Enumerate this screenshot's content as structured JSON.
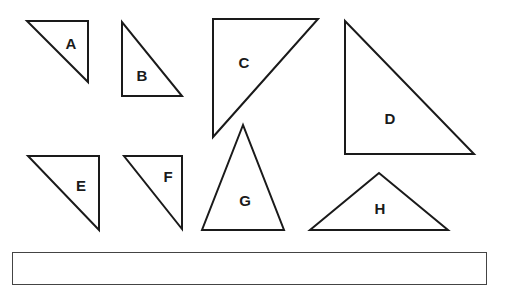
{
  "diagram": {
    "stroke_color": "#1a1a1a",
    "triangles": [
      {
        "label": "A",
        "points": "27,21 88,21 88,82",
        "label_pos": [
          71,
          43
        ]
      },
      {
        "label": "B",
        "points": "122,22 122,96 182,96",
        "label_pos": [
          142,
          75
        ]
      },
      {
        "label": "C",
        "points": "213,19 318,19 213,137",
        "label_pos": [
          244,
          62
        ]
      },
      {
        "label": "D",
        "points": "345,21 345,154 474,154",
        "label_pos": [
          390,
          118
        ]
      },
      {
        "label": "E",
        "points": "28,156 99,156 99,230",
        "label_pos": [
          81,
          185
        ]
      },
      {
        "label": "F",
        "points": "124,156 182,156 182,229",
        "label_pos": [
          168,
          176
        ]
      },
      {
        "label": "G",
        "points": "243,125 202,230 284,230",
        "label_pos": [
          245,
          200
        ]
      },
      {
        "label": "H",
        "points": "379,173 310,230 448,230",
        "label_pos": [
          380,
          208
        ]
      }
    ]
  },
  "answer_box": {
    "value": ""
  }
}
